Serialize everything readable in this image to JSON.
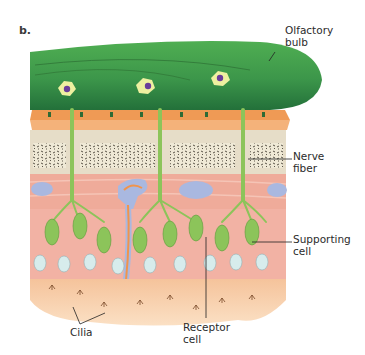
{
  "figure": {
    "panel_letter": "b.",
    "labels": {
      "olfactory_bulb": "Olfactory\nbulb",
      "nerve_fiber": "Nerve\nfiber",
      "supporting_cell": "Supporting\ncell",
      "receptor_cell": "Receptor\ncell",
      "cilia": "Cilia"
    },
    "colors": {
      "bulb_green": "#3f9a45",
      "bulb_dark": "#2a7a33",
      "nerve_green": "#8cc45a",
      "orange_layer": "#f0a35a",
      "bone": "#efe9d6",
      "mucosa_pink": "#eda79a",
      "epithelium_pink": "#f2b2a4",
      "mucus_peach": "#f8cda2",
      "gland_blue": "#a9b8e0",
      "mitral_cell": "#f1ef9c",
      "nucleus_purple": "#6a3d9a"
    }
  }
}
